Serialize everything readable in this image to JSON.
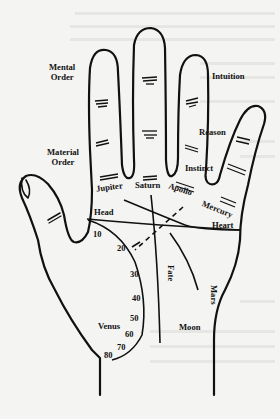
{
  "diagram": {
    "type": "palmistry-hand-map",
    "colors": {
      "ink": "#111111",
      "paper": "#f4f4f2"
    },
    "finger_labels": {
      "mental_order_1": "Mental",
      "mental_order_2": "Order",
      "material_order_1": "Material",
      "material_order_2": "Order",
      "intuition": "Intuition",
      "reason": "Reason",
      "instinct": "Instinct"
    },
    "mounts": {
      "jupiter": "Jupiter",
      "saturn": "Saturn",
      "apollo": "Apollo",
      "mercury": "Mercury",
      "venus": "Venus",
      "moon": "Moon",
      "mars": "Mars"
    },
    "lines": {
      "head": "Head",
      "heart": "Heart",
      "fate": "Fate"
    },
    "age_scale": [
      "10",
      "20",
      "30",
      "40",
      "50",
      "60",
      "70",
      "80"
    ]
  }
}
